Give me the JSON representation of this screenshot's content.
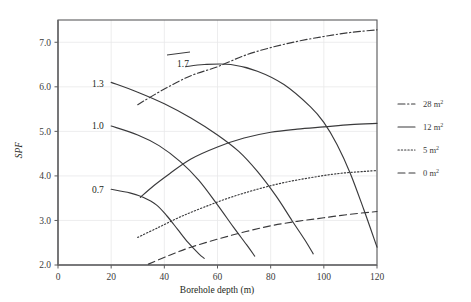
{
  "chart_data": {
    "type": "line",
    "title": "",
    "xlabel": "Borehole depth (m)",
    "ylabel": "SPF",
    "xlim": [
      0,
      120
    ],
    "ylim": [
      2.0,
      7.5
    ],
    "xticks": [
      0,
      20,
      40,
      60,
      80,
      100,
      120
    ],
    "xtick_labels": [
      "0",
      "20",
      "40",
      "60",
      "80",
      "100",
      "120"
    ],
    "yticks": [
      2.0,
      3.0,
      4.0,
      5.0,
      6.0,
      7.0
    ],
    "ytick_labels": [
      "2.0",
      "3.0",
      "4.0",
      "5.0",
      "6.0",
      "7.0"
    ],
    "grid": true,
    "legend_position": "right",
    "legend": [
      {
        "label": "28 m²",
        "label_value": "28",
        "unit": "m",
        "exponent": "2",
        "style": "dashdot"
      },
      {
        "label": "12 m²",
        "label_value": "12",
        "unit": "m",
        "exponent": "2",
        "style": "solid"
      },
      {
        "label": "5 m²",
        "label_value": "5",
        "unit": "m",
        "exponent": "2",
        "style": "dotted"
      },
      {
        "label": "0 m²",
        "label_value": "0",
        "unit": "m",
        "exponent": "2",
        "style": "dashed"
      }
    ],
    "curve_labels": [
      {
        "text": "1.7",
        "x": 47,
        "y": 6.53
      },
      {
        "text": "1.3",
        "x": 15,
        "y": 6.08
      },
      {
        "text": "1.0",
        "x": 15,
        "y": 5.12
      },
      {
        "text": "0.7",
        "x": 15,
        "y": 3.7
      }
    ],
    "series": [
      {
        "name": "28 m²",
        "style": "dashdot",
        "points": [
          [
            30,
            5.6
          ],
          [
            40,
            5.95
          ],
          [
            50,
            6.25
          ],
          [
            60,
            6.45
          ],
          [
            70,
            6.7
          ],
          [
            80,
            6.88
          ],
          [
            90,
            7.02
          ],
          [
            100,
            7.13
          ],
          [
            110,
            7.22
          ],
          [
            120,
            7.28
          ]
        ]
      },
      {
        "name": "12 m² (1.7)",
        "style": "solid",
        "points": [
          [
            48,
            6.45
          ],
          [
            55,
            6.5
          ],
          [
            65,
            6.5
          ],
          [
            75,
            6.35
          ],
          [
            85,
            6.05
          ],
          [
            95,
            5.55
          ],
          [
            100,
            5.2
          ],
          [
            105,
            4.7
          ],
          [
            110,
            4.05
          ],
          [
            115,
            3.25
          ],
          [
            120,
            2.4
          ]
        ]
      },
      {
        "name": "12 m² (1.3)",
        "style": "solid",
        "points": [
          [
            20,
            6.1
          ],
          [
            30,
            5.88
          ],
          [
            40,
            5.62
          ],
          [
            50,
            5.3
          ],
          [
            60,
            4.92
          ],
          [
            68,
            4.55
          ],
          [
            75,
            4.1
          ],
          [
            82,
            3.55
          ],
          [
            88,
            3.0
          ],
          [
            93,
            2.55
          ],
          [
            96,
            2.25
          ]
        ]
      },
      {
        "name": "12 m² (1.0)",
        "style": "solid",
        "points": [
          [
            20,
            5.12
          ],
          [
            30,
            4.92
          ],
          [
            38,
            4.68
          ],
          [
            46,
            4.32
          ],
          [
            53,
            3.9
          ],
          [
            60,
            3.35
          ],
          [
            66,
            2.85
          ],
          [
            71,
            2.45
          ],
          [
            74,
            2.2
          ]
        ]
      },
      {
        "name": "12 m² (0.7)",
        "style": "solid",
        "points": [
          [
            20,
            3.7
          ],
          [
            27,
            3.62
          ],
          [
            32,
            3.52
          ],
          [
            37,
            3.35
          ],
          [
            41,
            3.1
          ],
          [
            45,
            2.8
          ],
          [
            49,
            2.5
          ],
          [
            53,
            2.25
          ],
          [
            55,
            2.15
          ]
        ]
      },
      {
        "name": "12 m² (upper rising)",
        "style": "solid",
        "points": [
          [
            31,
            3.52
          ],
          [
            36,
            3.78
          ],
          [
            42,
            4.05
          ],
          [
            50,
            4.38
          ],
          [
            60,
            4.65
          ],
          [
            70,
            4.85
          ],
          [
            80,
            4.98
          ],
          [
            90,
            5.05
          ],
          [
            100,
            5.1
          ],
          [
            110,
            5.15
          ],
          [
            120,
            5.18
          ]
        ]
      },
      {
        "name": "5 m²",
        "style": "dotted",
        "points": [
          [
            30,
            2.62
          ],
          [
            38,
            2.85
          ],
          [
            46,
            3.08
          ],
          [
            55,
            3.3
          ],
          [
            65,
            3.52
          ],
          [
            75,
            3.7
          ],
          [
            85,
            3.85
          ],
          [
            95,
            3.96
          ],
          [
            105,
            4.05
          ],
          [
            115,
            4.1
          ],
          [
            120,
            4.12
          ]
        ]
      },
      {
        "name": "0 m²",
        "style": "dashed",
        "points": [
          [
            34,
            2.02
          ],
          [
            42,
            2.22
          ],
          [
            50,
            2.4
          ],
          [
            60,
            2.58
          ],
          [
            70,
            2.74
          ],
          [
            80,
            2.88
          ],
          [
            90,
            2.98
          ],
          [
            100,
            3.06
          ],
          [
            110,
            3.14
          ],
          [
            120,
            3.2
          ]
        ]
      }
    ]
  },
  "colors": {
    "curve": "#3a3a3c",
    "grid": "#e9e9ea",
    "frame": "#5b5b5d",
    "text": "#231f20",
    "background": "#ffffff"
  }
}
